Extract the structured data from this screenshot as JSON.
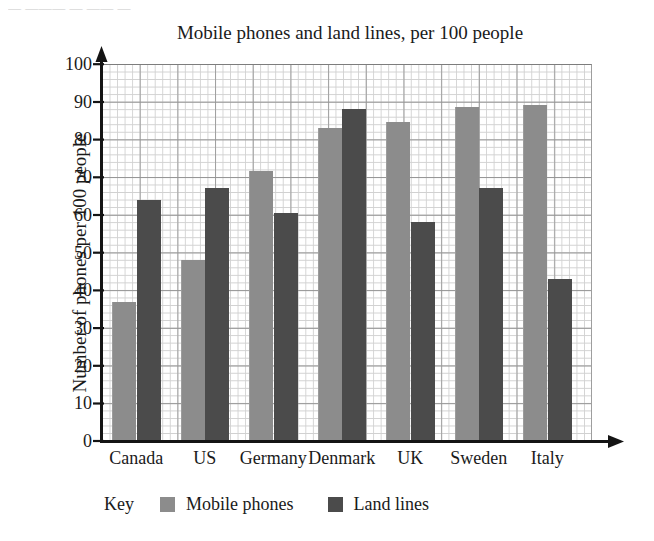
{
  "scan_artifact_text": "— ——— — —— —",
  "chart_data": {
    "type": "bar",
    "title": "Mobile phones and land lines, per 100 people",
    "xlabel": "",
    "ylabel": "Number of phones per 100 people",
    "ylim": [
      0,
      100
    ],
    "ytick_step": 10,
    "yticks": [
      100,
      90,
      80,
      70,
      60,
      50,
      40,
      30,
      20,
      10,
      0
    ],
    "grid": "graph-paper (minor 2 units, major 10 units)",
    "categories": [
      "Canada",
      "US",
      "Germany",
      "Denmark",
      "UK",
      "Sweden",
      "Italy"
    ],
    "series": [
      {
        "name": "Mobile phones",
        "color": "#8c8c8c",
        "values": [
          37,
          48,
          71.5,
          83,
          84.5,
          88.5,
          89
        ]
      },
      {
        "name": "Land lines",
        "color": "#4b4b4b",
        "values": [
          64,
          67,
          60.5,
          88,
          58,
          67,
          43
        ]
      }
    ],
    "legend": {
      "key_word": "Key",
      "position": "below-plot",
      "entries": [
        {
          "label": "Mobile phones",
          "swatch": "mobile"
        },
        {
          "label": "Land lines",
          "swatch": "land"
        }
      ]
    }
  }
}
